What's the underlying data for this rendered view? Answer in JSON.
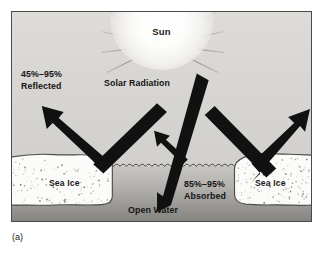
{
  "figure": {
    "caption": "(a)"
  },
  "sky": {
    "sun_label": "Sun",
    "sun_icon": "sun-glow-icon",
    "ray_count": 13
  },
  "annotations": {
    "reflected": {
      "line1": "45%–95%",
      "line2": "Reflected"
    },
    "solar_radiation": "Solar Radiation",
    "absorbed": {
      "line1": "85%–95%",
      "line2": "Absorbed"
    },
    "open_water": "Open Water"
  },
  "surface": {
    "ice_left_label": "Sea Ice",
    "ice_right_label": "Sea Ice",
    "water_label": "Open Water"
  },
  "colors": {
    "sky": "#d8d6d3",
    "water_top": "#c8c6c3",
    "water_bottom": "#87857f",
    "ice": "#fbfbfa",
    "arrow": "#111111",
    "frame": "#4a4a4a",
    "text": "#141414"
  },
  "chart_data": {
    "type": "diagram",
    "surfaces": [
      {
        "name": "Sea Ice",
        "process": "Reflected",
        "min_percent": 45,
        "max_percent": 95,
        "label": "45%–95% Reflected"
      },
      {
        "name": "Open Water",
        "process": "Absorbed",
        "min_percent": 85,
        "max_percent": 95,
        "label": "85%–95% Absorbed"
      }
    ],
    "source_label": "Solar Radiation",
    "rays": [
      {
        "id": "incoming-left",
        "role": "incoming",
        "target": "sea-ice-left"
      },
      {
        "id": "reflected-left",
        "role": "reflected",
        "target": "sea-ice-left"
      },
      {
        "id": "incoming-center",
        "role": "incoming",
        "target": "open-water"
      },
      {
        "id": "reflected-center",
        "role": "reflected",
        "target": "open-water"
      },
      {
        "id": "incoming-right",
        "role": "incoming",
        "target": "sea-ice-right"
      },
      {
        "id": "reflected-right",
        "role": "reflected",
        "target": "sea-ice-right"
      }
    ]
  }
}
